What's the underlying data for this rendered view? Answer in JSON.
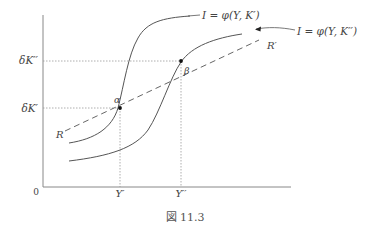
{
  "figure": {
    "caption": "図 11.3",
    "axes": {
      "origin_label": "0",
      "y_ticks": [
        {
          "label": "δK′′",
          "meaning": "level delta K double prime"
        },
        {
          "label": "δK′",
          "meaning": "level delta K prime"
        }
      ],
      "x_ticks": [
        {
          "label": "Y′"
        },
        {
          "label": "Y′′"
        }
      ]
    },
    "curves": {
      "upper_curve_label": "I = φ(Y, K′)",
      "lower_curve_label": "I = φ(Y, K′′)",
      "line_R_start_label": "R",
      "line_R_end_label": "R′"
    },
    "points": {
      "alpha": "α",
      "beta": "β"
    },
    "colors": {
      "curve": "#555555",
      "axis": "#777777",
      "guide": "#999999",
      "point": "#111111"
    }
  }
}
